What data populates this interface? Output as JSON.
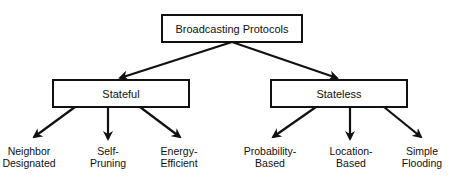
{
  "diagram": {
    "root": {
      "label": "Broadcasting Protocols"
    },
    "categories": [
      {
        "label": "Stateful",
        "children": [
          {
            "line1": "Neighbor",
            "line2": "Designated"
          },
          {
            "line1": "Self-",
            "line2": "Pruning"
          },
          {
            "line1": "Energy-",
            "line2": "Efficient"
          }
        ]
      },
      {
        "label": "Stateless",
        "children": [
          {
            "line1": "Probability-",
            "line2": "Based"
          },
          {
            "line1": "Location-",
            "line2": "Based"
          },
          {
            "line1": "Simple",
            "line2": "Flooding"
          }
        ]
      }
    ],
    "colors": {
      "stroke": "#111111",
      "background": "#ffffff"
    }
  }
}
